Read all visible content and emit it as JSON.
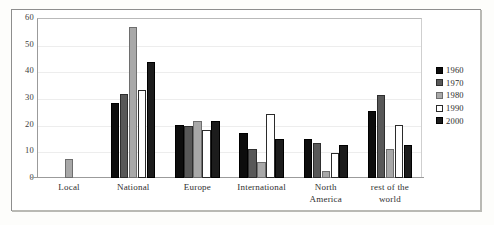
{
  "chart_data": {
    "type": "bar",
    "title": "",
    "subtitle": "",
    "xlabel": "",
    "ylabel": "",
    "ylim": [
      0,
      60
    ],
    "ytick_labels": [
      "60",
      "50",
      "40",
      "30",
      "20",
      "10",
      "0"
    ],
    "yticks": [
      60,
      50,
      40,
      30,
      20,
      10,
      0
    ],
    "grid": true,
    "legend_position": "right",
    "categories": [
      "Local",
      "National",
      "Europe",
      "International",
      "North America",
      "rest of the world"
    ],
    "category_label_lines": [
      [
        "Local"
      ],
      [
        "National"
      ],
      [
        "Europe"
      ],
      [
        "International"
      ],
      [
        "North",
        "America"
      ],
      [
        "rest of the",
        "world"
      ]
    ],
    "series": [
      {
        "name": "1960",
        "color": "#0d0d0d",
        "values": [
          null,
          28,
          20,
          17,
          14.5,
          25
        ]
      },
      {
        "name": "1970",
        "color": "#585858",
        "values": [
          null,
          31.5,
          19.5,
          11,
          13,
          31
        ]
      },
      {
        "name": "1980",
        "color": "#a8a8a8",
        "values": [
          7,
          56.5,
          21.5,
          6,
          2.5,
          11
        ]
      },
      {
        "name": "1990",
        "color": "#ffffff",
        "values": [
          null,
          33,
          18,
          24,
          9.5,
          20
        ]
      },
      {
        "name": "2000",
        "color": "#1c1c1c",
        "values": [
          null,
          43.5,
          21.5,
          14.5,
          12.5,
          12.5
        ]
      }
    ]
  }
}
